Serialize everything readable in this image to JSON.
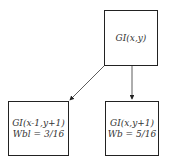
{
  "nodes": {
    "top": {
      "label": "GI(x,y)"
    },
    "bottom_left": {
      "label": "GI(x-1,y+1)",
      "weight": "Wbl = 3/16"
    },
    "bottom_right": {
      "label": "GI(x,y+1)",
      "weight": "Wb = 5/16"
    }
  },
  "edges": [
    {
      "from": "top",
      "to": "bottom_left"
    },
    {
      "from": "top",
      "to": "bottom_right"
    }
  ]
}
